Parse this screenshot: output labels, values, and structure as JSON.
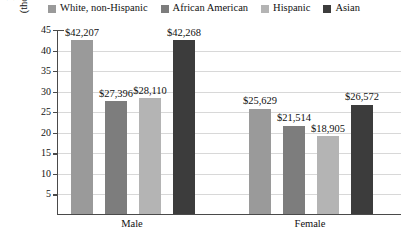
{
  "legend": {
    "items": [
      {
        "label": "White, non-Hispanic",
        "color": "#9a9a9a",
        "icon": "legend-swatch-icon"
      },
      {
        "label": "African American",
        "color": "#7d7d7d",
        "icon": "legend-swatch-icon"
      },
      {
        "label": "Hispanic",
        "color": "#b4b4b4",
        "icon": "legend-swatch-icon"
      },
      {
        "label": "Asian",
        "color": "#3c3c3c",
        "icon": "legend-swatch-icon"
      }
    ]
  },
  "axes": {
    "y_title_line1": "Median Income",
    "y_title_line2": "(thousands of dollars)",
    "y_ticks": [
      "45",
      "40",
      "35",
      "30",
      "25",
      "20",
      "15",
      "10",
      "5"
    ],
    "x_labels": [
      "Male",
      "Female"
    ]
  },
  "chart_data": {
    "type": "bar",
    "title": "",
    "xlabel": "",
    "ylabel": "Median Income (thousands of dollars)",
    "ylim": [
      0,
      45
    ],
    "ytick_step": 5,
    "grid": true,
    "legend_position": "top",
    "categories": [
      "Male",
      "Female"
    ],
    "series": [
      {
        "name": "White, non-Hispanic",
        "color": "#9a9a9a",
        "values": [
          42207,
          25629
        ],
        "labels": [
          "$42,207",
          "$25,629"
        ]
      },
      {
        "name": "African American",
        "color": "#7d7d7d",
        "values": [
          27396,
          21514
        ],
        "labels": [
          "$27,396",
          "$21,514"
        ]
      },
      {
        "name": "Hispanic",
        "color": "#b4b4b4",
        "values": [
          28110,
          18905
        ],
        "labels": [
          "$28,110",
          "$18,905"
        ]
      },
      {
        "name": "Asian",
        "color": "#3c3c3c",
        "values": [
          42268,
          26572
        ],
        "labels": [
          "$42,268",
          "$26,572"
        ]
      }
    ]
  }
}
